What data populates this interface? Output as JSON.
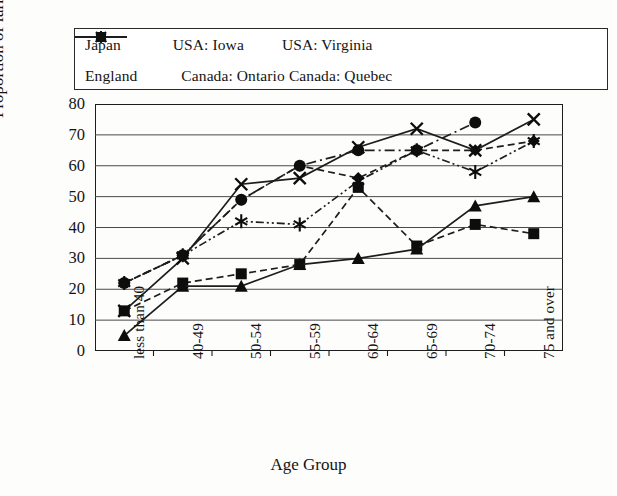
{
  "chart_data": {
    "type": "line",
    "title": "",
    "xlabel": "Age Group",
    "ylabel": "Proportion of farmers(%)",
    "ylim": [
      0,
      80
    ],
    "ytick_values": [
      0,
      10,
      20,
      30,
      40,
      50,
      60,
      70,
      80
    ],
    "grid": true,
    "legend_position": "top",
    "categories": [
      "less than 40",
      "40-49",
      "50-54",
      "55-59",
      "60-64",
      "65-69",
      "70-74",
      "75 and over"
    ],
    "series": [
      {
        "name": "Japan",
        "marker": "diamond",
        "linestyle": "dashed",
        "values": [
          22,
          31,
          49,
          60,
          56,
          65,
          65,
          68
        ]
      },
      {
        "name": "USA: Iowa",
        "marker": "square",
        "linestyle": "dashed",
        "values": [
          13,
          22,
          25,
          28,
          53,
          34,
          41,
          38
        ]
      },
      {
        "name": "USA: Virginia",
        "marker": "triangle",
        "linestyle": "solid",
        "values": [
          5,
          21,
          21,
          28,
          30,
          33,
          47,
          50
        ]
      },
      {
        "name": "England",
        "marker": "cross",
        "linestyle": "solid",
        "values": [
          13,
          30,
          54,
          56,
          66,
          72,
          65,
          75
        ]
      },
      {
        "name": "Canada: Ontario",
        "marker": "asterisk",
        "linestyle": "dash-dot-dot",
        "values": [
          22,
          31,
          42,
          41,
          55,
          65,
          58,
          68
        ]
      },
      {
        "name": "Canada: Quebec",
        "marker": "circle",
        "linestyle": "dash-dot",
        "values": [
          22,
          31,
          49,
          60,
          65,
          65,
          74,
          null
        ]
      }
    ]
  },
  "legend": {
    "rows": [
      [
        "Japan",
        "USA: Iowa",
        "USA: Virginia"
      ],
      [
        "England",
        "Canada: Ontario",
        "Canada: Quebec"
      ]
    ]
  },
  "axes": {
    "y_ticks": [
      "80",
      "70",
      "60",
      "50",
      "40",
      "30",
      "20",
      "10",
      "0"
    ],
    "x_ticks": [
      "less than 40",
      "40-49",
      "50-54",
      "55-59",
      "60-64",
      "65-69",
      "70-74",
      "75 and over"
    ]
  },
  "colors": {
    "ink": "#1d1d1d",
    "grid": "#555555",
    "paper": "#fdfdfc"
  }
}
